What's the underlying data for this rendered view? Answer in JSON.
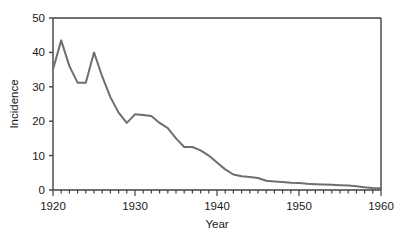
{
  "chart_data": {
    "type": "line",
    "title": "",
    "xlabel": "Year",
    "ylabel": "Incidence",
    "xlim": [
      1920,
      1960
    ],
    "ylim": [
      0,
      50
    ],
    "xticks": [
      1920,
      1930,
      1940,
      1950,
      1960
    ],
    "xtick_labels": [
      "1920",
      "1930",
      "1940",
      "1950",
      "1960"
    ],
    "yticks": [
      0,
      10,
      20,
      30,
      40,
      50
    ],
    "ytick_labels": [
      "0",
      "10",
      "20",
      "30",
      "40",
      "50"
    ],
    "minor_xtick_interval": 1,
    "grid": false,
    "legend": false,
    "legend_position": "none",
    "line_color": "#6e6e6e",
    "axis_color": "#404040",
    "line_width": 2,
    "x": [
      1920,
      1921,
      1922,
      1923,
      1924,
      1925,
      1926,
      1927,
      1928,
      1929,
      1930,
      1931,
      1932,
      1933,
      1934,
      1935,
      1936,
      1937,
      1938,
      1939,
      1940,
      1941,
      1942,
      1943,
      1944,
      1945,
      1946,
      1947,
      1948,
      1949,
      1950,
      1951,
      1952,
      1953,
      1954,
      1955,
      1956,
      1957,
      1958,
      1959,
      1960
    ],
    "values": [
      35.0,
      43.5,
      36.0,
      31.2,
      31.2,
      40.0,
      33.0,
      27.0,
      22.5,
      19.5,
      22.0,
      21.8,
      21.5,
      19.5,
      18.0,
      15.0,
      12.5,
      12.5,
      11.5,
      10.0,
      8.0,
      6.0,
      4.5,
      4.0,
      3.8,
      3.5,
      2.7,
      2.5,
      2.3,
      2.1,
      2.0,
      1.8,
      1.7,
      1.6,
      1.5,
      1.4,
      1.3,
      1.1,
      0.8,
      0.6,
      0.5
    ],
    "series": [
      {
        "name": "Incidence",
        "values": [
          35.0,
          43.5,
          36.0,
          31.2,
          31.2,
          40.0,
          33.0,
          27.0,
          22.5,
          19.5,
          22.0,
          21.8,
          21.5,
          19.5,
          18.0,
          15.0,
          12.5,
          12.5,
          11.5,
          10.0,
          8.0,
          6.0,
          4.5,
          4.0,
          3.8,
          3.5,
          2.7,
          2.5,
          2.3,
          2.1,
          2.0,
          1.8,
          1.7,
          1.6,
          1.5,
          1.4,
          1.3,
          1.1,
          0.8,
          0.6,
          0.5
        ]
      }
    ]
  }
}
